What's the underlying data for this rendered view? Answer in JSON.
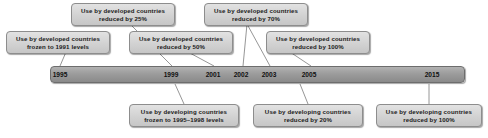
{
  "figure": {
    "bar_color": "#9c9c9c",
    "box_color": "#d4d4d4",
    "line_color": "#8a8a8a"
  },
  "timeline": {
    "years": [
      {
        "label": "1995",
        "x": 60
      },
      {
        "label": "1999",
        "x": 171
      },
      {
        "label": "2001",
        "x": 213
      },
      {
        "label": "2002",
        "x": 241
      },
      {
        "label": "2003",
        "x": 269
      },
      {
        "label": "2005",
        "x": 309
      },
      {
        "label": "2015",
        "x": 432
      }
    ]
  },
  "callouts_above": [
    {
      "id": "developed-1991-freeze",
      "line1": "Use by developed countries",
      "line2": "frozen to 1991 levels",
      "x": 6,
      "y": 31,
      "width": 104,
      "anchor_x": 66,
      "leader_to_x": 66
    },
    {
      "id": "developed-25",
      "line1": "Use by developed countries",
      "line2": "reduced by 25%",
      "x": 71,
      "y": 3,
      "width": 104,
      "anchor_x": 177,
      "leader_to_x": 177
    },
    {
      "id": "developed-50",
      "line1": "Use by developed countries",
      "line2": "reduced by 50%",
      "x": 129,
      "y": 31,
      "width": 104,
      "anchor_x": 219,
      "leader_to_x": 219
    },
    {
      "id": "developed-70",
      "line1": "Use by developed countries",
      "line2": "reduced by 70%",
      "x": 204,
      "y": 3,
      "width": 104,
      "anchor_x": 247,
      "leader_to_x": 247
    },
    {
      "id": "developed-100",
      "line1": "Use by developed countries",
      "line2": "reduced by 100%",
      "x": 266,
      "y": 31,
      "width": 104,
      "anchor_x": 315,
      "leader_to_x": 315
    }
  ],
  "callouts_below": [
    {
      "id": "developing-1995-1998-freeze",
      "line1": "Use by developing countries",
      "line2": "frozen to 1995–1998 levels",
      "x": 129,
      "y": 104,
      "width": 110,
      "anchor_x": 184,
      "leader_to_x": 184
    },
    {
      "id": "developing-20",
      "line1": "Use by developing countries",
      "line2": "reduced by 20%",
      "x": 253,
      "y": 104,
      "width": 110,
      "anchor_x": 308,
      "leader_to_x": 308
    },
    {
      "id": "developing-100",
      "line1": "Use by developing countries",
      "line2": "reduced by 100%",
      "x": 376,
      "y": 104,
      "width": 106,
      "anchor_x": 429,
      "leader_to_x": 429
    }
  ],
  "leaders": [
    {
      "id": "leader-developed-1991",
      "x1": 66,
      "y1": 52,
      "x2": 60,
      "y2": 66
    },
    {
      "id": "leader-developed-25",
      "x1": 130,
      "y1": 24,
      "x2": 172,
      "y2": 66
    },
    {
      "id": "leader-developed-50",
      "x1": 188,
      "y1": 52,
      "x2": 214,
      "y2": 66
    },
    {
      "id": "leader-developed-70",
      "x1": 247,
      "y1": 24,
      "x2": 270,
      "y2": 66
    },
    {
      "id": "leader-developed-70b",
      "x1": 247,
      "y1": 24,
      "x2": 243,
      "y2": 66
    },
    {
      "id": "leader-developed-100",
      "x1": 290,
      "y1": 52,
      "x2": 311,
      "y2": 66
    },
    {
      "id": "leader-developing-freeze",
      "x1": 184,
      "y1": 104,
      "x2": 175,
      "y2": 84
    },
    {
      "id": "leader-developing-20",
      "x1": 308,
      "y1": 104,
      "x2": 300,
      "y2": 84
    },
    {
      "id": "leader-developing-100",
      "x1": 429,
      "y1": 104,
      "x2": 429,
      "y2": 84
    }
  ]
}
